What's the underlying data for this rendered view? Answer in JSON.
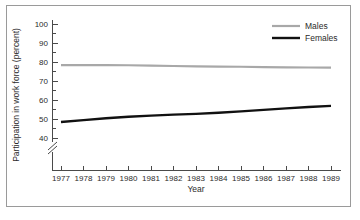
{
  "chart_data": {
    "type": "line",
    "title": "",
    "xlabel": "Year",
    "ylabel": "Participation in work force (percent)",
    "x": [
      1977,
      1978,
      1979,
      1980,
      1981,
      1982,
      1983,
      1984,
      1985,
      1986,
      1987,
      1988,
      1989
    ],
    "xtick_labels": [
      "1977",
      "1978",
      "1979",
      "1980",
      "1981",
      "1982",
      "1983",
      "1984",
      "1985",
      "1986",
      "1987",
      "1988",
      "1989"
    ],
    "ytick_labels": [
      "40",
      "50",
      "60",
      "70",
      "80",
      "90",
      "100"
    ],
    "yticks": [
      40,
      50,
      60,
      70,
      80,
      90,
      100
    ],
    "ylim": [
      36,
      102
    ],
    "xlim": [
      1976.5,
      1989.5
    ],
    "y_axis_break": true,
    "grid": false,
    "legend_position": "top-right",
    "series": [
      {
        "name": "Males",
        "color": "#a8a8a8",
        "line_width": 2.2,
        "values": [
          78.4,
          78.4,
          78.4,
          78.3,
          78.1,
          77.9,
          77.7,
          77.6,
          77.5,
          77.3,
          77.2,
          77.1,
          77.0
        ]
      },
      {
        "name": "Females",
        "color": "#111111",
        "line_width": 2.4,
        "values": [
          48.4,
          49.4,
          50.4,
          51.2,
          51.8,
          52.3,
          52.7,
          53.3,
          54.0,
          54.8,
          55.6,
          56.3,
          56.9
        ]
      }
    ]
  },
  "legend": {
    "entries": [
      {
        "label": "Males"
      },
      {
        "label": "Females"
      }
    ]
  },
  "axis": {
    "x_title": "Year",
    "y_title": "Participation in work force (percent)"
  }
}
